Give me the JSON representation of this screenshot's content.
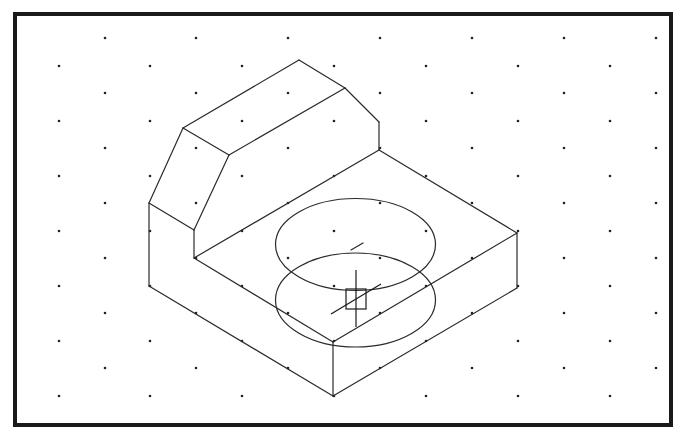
{
  "drawing": {
    "view": "isometric",
    "frame": {
      "x": 15,
      "y": 14,
      "width": 656,
      "height": 411,
      "stroke": "#1a1a1a"
    },
    "grid": {
      "rows_y": [
        38,
        66,
        93,
        121,
        148,
        176,
        203,
        231,
        258,
        286,
        313,
        341,
        368,
        396
      ],
      "odd_cols_x": [
        105,
        196,
        288,
        380,
        472,
        564,
        656
      ],
      "even_cols_x": [
        59,
        150,
        242,
        334,
        426,
        518,
        610
      ],
      "dot_color": "#222222"
    },
    "object": {
      "name": "isometric-block-with-chamfered-upright",
      "edges": [
        [
          [
            149,
            203
          ],
          [
            183,
            128
          ]
        ],
        [
          [
            183,
            128
          ],
          [
            299,
            60
          ]
        ],
        [
          [
            299,
            60
          ],
          [
            345,
            88
          ]
        ],
        [
          [
            345,
            88
          ],
          [
            379,
            122
          ]
        ],
        [
          [
            379,
            122
          ],
          [
            379,
            150
          ]
        ],
        [
          [
            183,
            128
          ],
          [
            229,
            155
          ]
        ],
        [
          [
            229,
            155
          ],
          [
            345,
            88
          ]
        ],
        [
          [
            229,
            155
          ],
          [
            194,
            230
          ]
        ],
        [
          [
            149,
            203
          ],
          [
            194,
            230
          ]
        ],
        [
          [
            194,
            230
          ],
          [
            194,
            258
          ]
        ],
        [
          [
            149,
            203
          ],
          [
            149,
            286
          ]
        ],
        [
          [
            194,
            258
          ],
          [
            379,
            150
          ]
        ],
        [
          [
            379,
            150
          ],
          [
            517,
            233
          ]
        ],
        [
          [
            194,
            258
          ],
          [
            333,
            342
          ]
        ],
        [
          [
            333,
            342
          ],
          [
            517,
            233
          ]
        ],
        [
          [
            149,
            286
          ],
          [
            333,
            396
          ]
        ],
        [
          [
            333,
            342
          ],
          [
            333,
            396
          ]
        ],
        [
          [
            517,
            233
          ],
          [
            517,
            288
          ]
        ],
        [
          [
            333,
            396
          ],
          [
            517,
            288
          ]
        ]
      ],
      "ellipses": [
        {
          "name": "upper-hole-ellipse",
          "cx": 355.5,
          "cy": 244.5,
          "rx": 80,
          "ry": 46
        },
        {
          "name": "lower-hole-ellipse",
          "cx": 355.5,
          "cy": 300,
          "rx": 80,
          "ry": 47
        }
      ],
      "center_mark": {
        "x1": 351,
        "y1": 250,
        "x2": 363,
        "y2": 243
      }
    },
    "cursor": {
      "type": "crosshair-pickbox",
      "box": {
        "x": 346,
        "y": 289,
        "size": 20
      },
      "vertical": {
        "x": 356,
        "y1": 270,
        "y2": 327
      },
      "diagonal": {
        "x1": 331,
        "y1": 314,
        "x2": 381,
        "y2": 284
      }
    }
  }
}
